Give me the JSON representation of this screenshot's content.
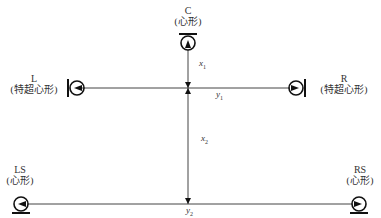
{
  "diagram": {
    "title": "",
    "microphones": [
      {
        "id": "C",
        "name": "C",
        "pattern": "(心形)",
        "orientation": "down"
      },
      {
        "id": "L",
        "name": "L",
        "pattern": "(特超心形)",
        "orientation": "right"
      },
      {
        "id": "R",
        "name": "R",
        "pattern": "(特超心形)",
        "orientation": "left"
      },
      {
        "id": "LS",
        "name": "LS",
        "pattern": "(心形)",
        "orientation": "right"
      },
      {
        "id": "RS",
        "name": "RS",
        "pattern": "(心形)",
        "orientation": "left"
      }
    ],
    "dimensions": {
      "x1": {
        "base": "x",
        "sub": "1"
      },
      "x2": {
        "base": "x",
        "sub": "2"
      },
      "y1": {
        "base": "y",
        "sub": "1"
      },
      "y2": {
        "base": "y",
        "sub": "2"
      }
    },
    "colors": {
      "line": "#444444",
      "symbol": "#111111",
      "background": "#ffffff"
    }
  }
}
